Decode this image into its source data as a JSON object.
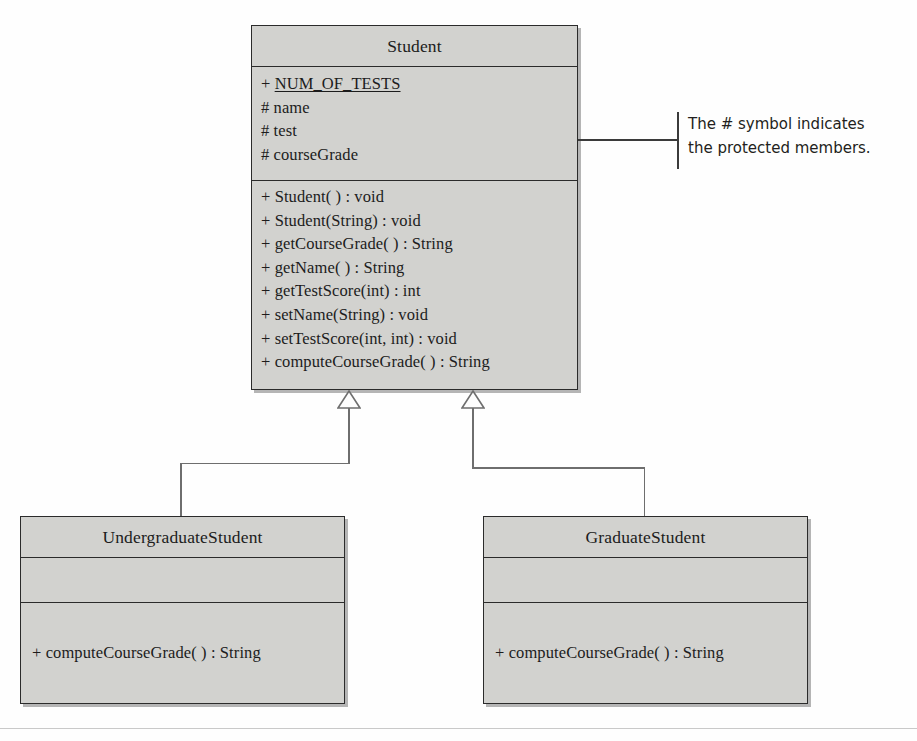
{
  "diagram": {
    "type": "uml-class-diagram",
    "colors": {
      "box_fill": "#d2d2cf",
      "box_border": "#2b2b2b",
      "text": "#1c1c1c",
      "edge": "#6e6e6e",
      "annotation_text": "#231f20",
      "annotation_bar": "#3b3b3b",
      "rule": "#c9c9c9"
    },
    "classes": {
      "student": {
        "name": "Student",
        "attributes": [
          {
            "visibility": "+",
            "name": "NUM_OF_TESTS",
            "static": true
          },
          {
            "visibility": "#",
            "name": "name",
            "static": false
          },
          {
            "visibility": "#",
            "name": "test",
            "static": false
          },
          {
            "visibility": "#",
            "name": "courseGrade",
            "static": false
          }
        ],
        "operations": [
          "+ Student( ) : void",
          "+ Student(String) : void",
          "+ getCourseGrade( ) : String",
          "+ getName( ) : String",
          "+ getTestScore(int) : int",
          "+ setName(String) : void",
          "+ setTestScore(int, int) : void",
          "+ computeCourseGrade( ) : String"
        ]
      },
      "undergraduate": {
        "name": "UndergraduateStudent",
        "attributes": [],
        "operations": [
          "+ computeCourseGrade( ) : String"
        ]
      },
      "graduate": {
        "name": "GraduateStudent",
        "attributes": [],
        "operations": [
          "+ computeCourseGrade( ) : String"
        ]
      }
    },
    "relationships": [
      {
        "kind": "generalization",
        "from": "UndergraduateStudent",
        "to": "Student"
      },
      {
        "kind": "generalization",
        "from": "GraduateStudent",
        "to": "Student"
      }
    ],
    "annotation": {
      "line1": "The # symbol indicates",
      "line2": "the protected members."
    }
  }
}
